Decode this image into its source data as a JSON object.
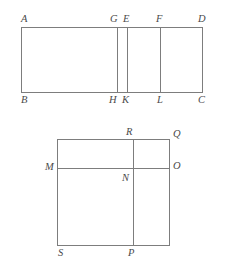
{
  "figure": {
    "stroke_color": "#7d7d7d",
    "label_color": "#4a4a4a",
    "background_color": "#ffffff",
    "stroke_width": 1
  },
  "top_figure": {
    "name": "rectangle-abcd",
    "description": "Rectangle ABCD divided by three vertical segments GH, EK and FL",
    "outline": {
      "x": 21,
      "y": 27,
      "width": 182,
      "height": 66
    },
    "vertical_cuts": [
      {
        "name": "GH",
        "x": 117,
        "top_label": "G",
        "bottom_label": "H"
      },
      {
        "name": "EK",
        "x": 127,
        "top_label": "E",
        "bottom_label": "K"
      },
      {
        "name": "FL",
        "x": 160,
        "top_label": "F",
        "bottom_label": "L"
      }
    ],
    "labels": {
      "a": "A",
      "b": "B",
      "c": "C",
      "d": "D",
      "e": "E",
      "f": "F",
      "g": "G",
      "h": "H",
      "k": "K",
      "l": "L"
    }
  },
  "bottom_figure": {
    "name": "square-dissection",
    "description": "Square divided by horizontal segment MO and vertical segment RP meeting at N",
    "outline": {
      "x": 57,
      "y": 139,
      "width": 113,
      "height": 107
    },
    "horizontal_cut": {
      "name": "MO",
      "y": 168,
      "left_label": "M",
      "right_label": "O"
    },
    "vertical_cut": {
      "name": "RP",
      "x": 133,
      "top_label": "R",
      "bottom_label": "P"
    },
    "intersection": {
      "name": "N",
      "x": 133,
      "y": 168,
      "label": "N"
    },
    "labels": {
      "m": "M",
      "n": "N",
      "o": "O",
      "p": "P",
      "q": "Q",
      "r": "R",
      "s": "S"
    }
  }
}
